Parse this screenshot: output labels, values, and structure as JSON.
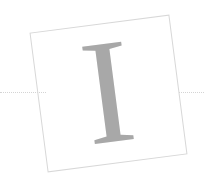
{
  "canvas": {
    "width": 204,
    "height": 191,
    "background_color": "#ffffff"
  },
  "frame": {
    "shape": "square",
    "rotation_degrees": -7.4,
    "border_color": "#d8d8d8",
    "fill": "none",
    "label": ""
  },
  "glyph": {
    "character": "I",
    "style": "serif capital",
    "color": "#a8a8a8",
    "rendering": "dithered halftone gray"
  },
  "rule": {
    "left_label": "",
    "right_label": "",
    "color": "#d4d4d4",
    "style": "dotted"
  }
}
